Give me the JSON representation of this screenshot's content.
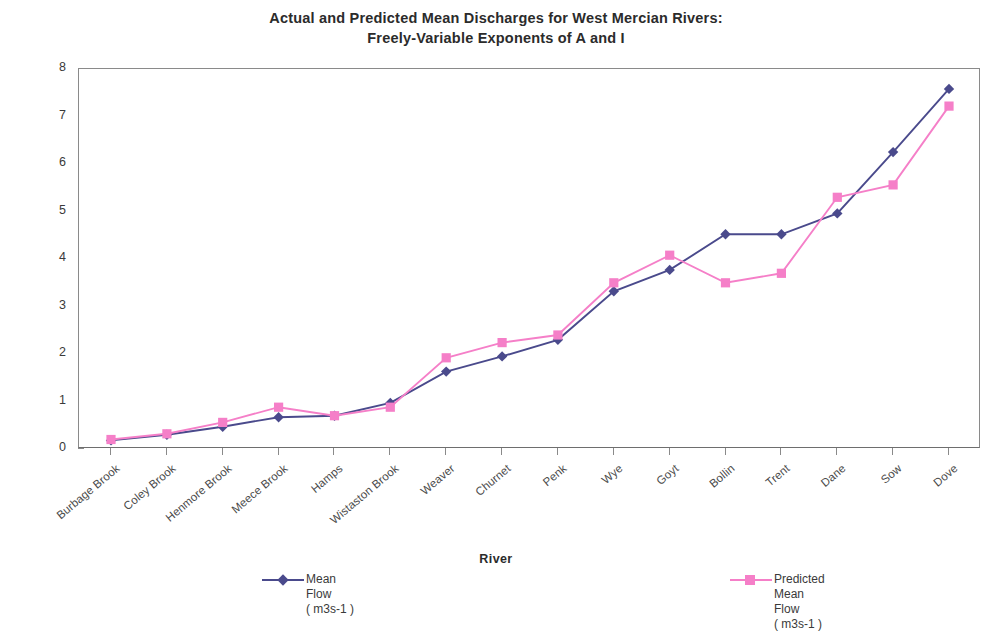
{
  "chart_data": {
    "type": "line",
    "title": "Actual and Predicted Mean Discharges for West Mercian Rivers:",
    "subtitle": "Freely-Variable Exponents of A and I",
    "xlabel": "River",
    "ylabel": "Mean Flow in Cumecs",
    "ylim": [
      0,
      8
    ],
    "ytick_labels": [
      "0",
      "1",
      "2",
      "3",
      "4",
      "5",
      "6",
      "7",
      "8"
    ],
    "grid": false,
    "legend_position": "bottom",
    "categories": [
      "Burbage Brook",
      "Coley Brook",
      "Henmore Brook",
      "Meece Brook",
      "Hamps",
      "Wistaston Brook",
      "Weaver",
      "Churnet",
      "Penk",
      "Wye",
      "Goyt",
      "Bollin",
      "Trent",
      "Dane",
      "Sow",
      "Dove"
    ],
    "series": [
      {
        "name": "Mean Flow ( m3s-1 )",
        "legend_label": "Mean\nFlow\n( m3s-1 )",
        "color": "#4a4a8c",
        "marker": "diamond",
        "values": [
          0.18,
          0.3,
          0.47,
          0.67,
          0.7,
          0.97,
          1.63,
          1.95,
          2.3,
          3.32,
          3.77,
          4.52,
          4.52,
          4.96,
          6.25,
          7.58
        ]
      },
      {
        "name": "Predicted Mean Flow ( m3s-1 )",
        "legend_label": "Predicted\nMean\nFlow\n( m3s-1 )",
        "color": "#f57fc8",
        "marker": "square",
        "values": [
          0.2,
          0.32,
          0.56,
          0.88,
          0.7,
          0.88,
          1.92,
          2.24,
          2.4,
          3.5,
          4.08,
          3.5,
          3.7,
          5.3,
          5.56,
          7.22
        ]
      }
    ]
  }
}
